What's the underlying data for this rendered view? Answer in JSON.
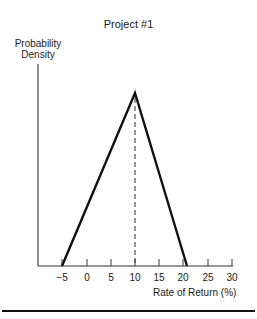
{
  "chart_data": {
    "type": "line",
    "title": "Project #1",
    "xlabel": "Rate of Return (%)",
    "ylabel": "Probability Density",
    "x_ticks": [
      -5,
      0,
      5,
      10,
      15,
      20,
      25,
      30
    ],
    "x_tick_labels": [
      "−5",
      "0",
      "5",
      "10",
      "15",
      "20",
      "25",
      "30"
    ],
    "xlim": [
      -10,
      30
    ],
    "grid": false,
    "legend": null,
    "series": [
      {
        "name": "Probability Density",
        "shape": "triangular",
        "x": [
          -5,
          10,
          20.5
        ],
        "y": [
          0,
          1,
          0
        ]
      }
    ],
    "annotations": [
      {
        "type": "dashed-vertical-line",
        "x": 10,
        "label": "expected/most likely return"
      }
    ]
  },
  "title": "Project #1",
  "axis": {
    "y_label_line1": "Probability",
    "y_label_line2": "Density",
    "x_label": "Rate of Return (%)",
    "ticks": [
      {
        "label": "−5",
        "x": 62
      },
      {
        "label": "0",
        "x": 87
      },
      {
        "label": "5",
        "x": 111
      },
      {
        "label": "10",
        "x": 135
      },
      {
        "label": "15",
        "x": 159
      },
      {
        "label": "20",
        "x": 183
      },
      {
        "label": "25",
        "x": 208
      },
      {
        "label": "30",
        "x": 232
      }
    ]
  }
}
